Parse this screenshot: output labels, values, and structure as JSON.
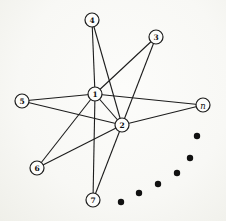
{
  "diagram": {
    "colors": {
      "background": "#f9f9f6",
      "line": "#1c1c1c",
      "node_fill": "#fdfdfb",
      "node_stroke": "#1c1c1c",
      "label": "#111111",
      "dot": "#111111"
    },
    "node_radius": 7,
    "dot_radius": 3.2,
    "line_width": 1.1,
    "node_stroke_width": 1.2,
    "label_font_size": 7.5,
    "nodes": [
      {
        "id": "4",
        "label": "4",
        "x": 92,
        "y": 20,
        "italic": false
      },
      {
        "id": "3",
        "label": "3",
        "x": 156,
        "y": 37,
        "italic": false
      },
      {
        "id": "1",
        "label": "1",
        "x": 95,
        "y": 94,
        "italic": false
      },
      {
        "id": "5",
        "label": "5",
        "x": 22,
        "y": 101,
        "italic": false
      },
      {
        "id": "n",
        "label": "n",
        "x": 203,
        "y": 105,
        "italic": true
      },
      {
        "id": "2",
        "label": "2",
        "x": 122,
        "y": 125,
        "italic": false
      },
      {
        "id": "6",
        "label": "6",
        "x": 37,
        "y": 168,
        "italic": false
      },
      {
        "id": "7",
        "label": "7",
        "x": 93,
        "y": 200,
        "italic": false
      }
    ],
    "edges": [
      [
        "1",
        "4"
      ],
      [
        "1",
        "3"
      ],
      [
        "1",
        "5"
      ],
      [
        "1",
        "n"
      ],
      [
        "1",
        "6"
      ],
      [
        "1",
        "7"
      ],
      [
        "1",
        "2"
      ],
      [
        "2",
        "4"
      ],
      [
        "2",
        "3"
      ],
      [
        "2",
        "5"
      ],
      [
        "2",
        "n"
      ],
      [
        "2",
        "6"
      ],
      [
        "2",
        "7"
      ]
    ],
    "ellipsis_dots": [
      {
        "x": 121,
        "y": 202
      },
      {
        "x": 139,
        "y": 193
      },
      {
        "x": 158,
        "y": 184
      },
      {
        "x": 177,
        "y": 173
      },
      {
        "x": 190,
        "y": 158
      },
      {
        "x": 197,
        "y": 136
      }
    ]
  }
}
